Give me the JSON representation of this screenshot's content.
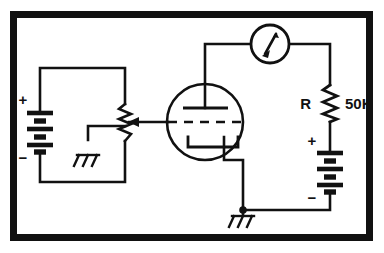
{
  "figure": {
    "background_color": "#ffffff",
    "ink_color": "#111111",
    "frame": {
      "name": "outer-border-frame",
      "style": "thick solid black rectangle",
      "color": "#111111",
      "x": 10,
      "y": 11,
      "width": 363,
      "height": 230,
      "stroke_width": 7
    }
  },
  "labels": {
    "resistor_designator": "R",
    "resistor_value": "50K",
    "left_battery_positive": "+",
    "left_battery_negative": "−",
    "right_battery_positive": "+",
    "right_battery_negative": "−"
  },
  "components": [
    {
      "id": "left-battery",
      "type": "battery",
      "name": "grid-bias-battery",
      "cells": 4,
      "polarity_top": "+",
      "polarity_bottom": "−",
      "x": 40,
      "y": 110,
      "orientation": "vertical"
    },
    {
      "id": "potentiometer",
      "type": "potentiometer",
      "name": "bias-potentiometer",
      "wiper": "arrow-from-right",
      "x": 125,
      "y": 120,
      "orientation": "vertical"
    },
    {
      "id": "chassis-ground-left",
      "type": "ground",
      "name": "chassis-ground-symbol",
      "x": 88,
      "y": 140
    },
    {
      "id": "vacuum-tube",
      "type": "triode",
      "name": "vacuum-tube-triode",
      "elements": [
        "plate",
        "grid",
        "cathode"
      ],
      "grid_style": "dashed",
      "cx": 205,
      "cy": 122,
      "r": 38
    },
    {
      "id": "meter",
      "type": "meter",
      "name": "plate-current-meter",
      "cx": 270,
      "cy": 44,
      "r": 19
    },
    {
      "id": "resistor",
      "type": "resistor",
      "name": "plate-load-resistor",
      "designator": "R",
      "value": "50K",
      "x": 330,
      "y": 85,
      "orientation": "vertical"
    },
    {
      "id": "right-battery",
      "type": "battery",
      "name": "plate-supply-battery",
      "cells": 4,
      "polarity_top": "+",
      "polarity_bottom": "−",
      "x": 330,
      "y": 150,
      "orientation": "vertical"
    },
    {
      "id": "chassis-ground-bottom",
      "type": "ground",
      "name": "chassis-ground-symbol",
      "x": 243,
      "y": 210
    },
    {
      "id": "junction-dot",
      "type": "junction",
      "name": "cathode-ground-junction",
      "x": 243,
      "y": 210
    }
  ]
}
